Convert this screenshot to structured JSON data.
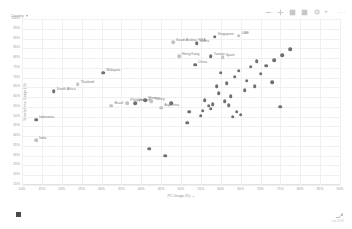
{
  "toolbar": {
    "icons": [
      {
        "name": "zoom-out-icon",
        "glyph": "minus"
      },
      {
        "name": "zoom-in-icon",
        "glyph": "plus"
      },
      {
        "name": "filter-icon",
        "glyph": "filter"
      },
      {
        "name": "table-icon",
        "glyph": "table"
      },
      {
        "name": "gear-icon",
        "glyph": "gear"
      },
      {
        "name": "more-options-icon",
        "glyph": "ellipsis"
      }
    ],
    "more_label": "···"
  },
  "legend": {
    "label": "Country"
  },
  "watermark": {
    "text": "nat 2019"
  },
  "chart_data": {
    "type": "scatter",
    "title": "",
    "xlabel": "PC Usage (%)",
    "ylabel": "Smartphone Usage (%)",
    "xlim": [
      10,
      90
    ],
    "ylim": [
      15,
      100
    ],
    "grid": true,
    "legend_position": "top-left",
    "xticks": [
      "10%",
      "15%",
      "20%",
      "25%",
      "30%",
      "35%",
      "40%",
      "45%",
      "50%",
      "55%",
      "60%",
      "65%",
      "70%",
      "75%",
      "80%",
      "85%",
      "90%"
    ],
    "yticks": [
      "100%",
      "95%",
      "90%",
      "85%",
      "80%",
      "75%",
      "70%",
      "65%",
      "60%",
      "55%",
      "50%",
      "45%",
      "40%",
      "35%",
      "30%",
      "25%",
      "20%",
      "15%"
    ],
    "points": [
      {
        "label": "India",
        "x": 13.5,
        "y": 38.0,
        "labeled": true,
        "shade": "light"
      },
      {
        "label": "Indonesia",
        "x": 13.5,
        "y": 48.5,
        "labeled": true,
        "shade": "dark"
      },
      {
        "label": "South Africa",
        "x": 18.0,
        "y": 63.0,
        "labeled": true,
        "shade": "dark"
      },
      {
        "label": "Thailand",
        "x": 24.0,
        "y": 66.5,
        "labeled": true,
        "shade": "light"
      },
      {
        "label": "Malaysia",
        "x": 30.5,
        "y": 72.5,
        "labeled": true,
        "shade": "dark"
      },
      {
        "label": "Brazil",
        "x": 32.5,
        "y": 55.5,
        "labeled": true,
        "shade": "light"
      },
      {
        "label": "Philippines",
        "x": 36.5,
        "y": 57.0,
        "labeled": true,
        "shade": "light"
      },
      {
        "label": "Vietnam",
        "x": 38.5,
        "y": 57.0,
        "labeled": true,
        "shade": "dark"
      },
      {
        "label": "Mexico",
        "x": 41.0,
        "y": 58.5,
        "labeled": true,
        "shade": "dark"
      },
      {
        "label": "Turkey",
        "x": 42.5,
        "y": 58.0,
        "labeled": true,
        "shade": "light"
      },
      {
        "label": "Argentina",
        "x": 45.0,
        "y": 54.5,
        "labeled": true,
        "shade": "light"
      },
      {
        "label": "Saudi Arabia / KSA",
        "x": 48.0,
        "y": 88.0,
        "labeled": true,
        "shade": "light"
      },
      {
        "label": "Korea",
        "x": 54.0,
        "y": 87.5,
        "labeled": true,
        "shade": "dark"
      },
      {
        "label": "Hong Kong",
        "x": 49.5,
        "y": 81.0,
        "labeled": true,
        "shade": "light"
      },
      {
        "label": "Singapore",
        "x": 58.5,
        "y": 91.0,
        "labeled": true,
        "shade": "dark"
      },
      {
        "label": "UAE",
        "x": 64.5,
        "y": 91.5,
        "labeled": true,
        "shade": "light"
      },
      {
        "label": "Taiwan",
        "x": 57.5,
        "y": 81.0,
        "labeled": true,
        "shade": "dark"
      },
      {
        "label": "Spain",
        "x": 60.5,
        "y": 80.5,
        "labeled": true,
        "shade": "light"
      },
      {
        "label": "China",
        "x": 53.5,
        "y": 76.5,
        "labeled": true,
        "shade": "dark"
      },
      {
        "label": "",
        "x": 52.0,
        "y": 52.5,
        "labeled": false,
        "shade": "dark"
      },
      {
        "label": "",
        "x": 51.5,
        "y": 47.0,
        "labeled": false,
        "shade": "dark"
      },
      {
        "label": "",
        "x": 47.5,
        "y": 57.0,
        "labeled": false,
        "shade": "dark"
      },
      {
        "label": "",
        "x": 56.0,
        "y": 58.5,
        "labeled": false,
        "shade": "dark"
      },
      {
        "label": "",
        "x": 55.5,
        "y": 53.0,
        "labeled": false,
        "shade": "dark"
      },
      {
        "label": "",
        "x": 55.0,
        "y": 50.5,
        "labeled": false,
        "shade": "dark"
      },
      {
        "label": "",
        "x": 57.0,
        "y": 55.5,
        "labeled": false,
        "shade": "dark"
      },
      {
        "label": "",
        "x": 57.5,
        "y": 54.0,
        "labeled": false,
        "shade": "dark"
      },
      {
        "label": "",
        "x": 58.0,
        "y": 56.5,
        "labeled": false,
        "shade": "dark"
      },
      {
        "label": "",
        "x": 59.5,
        "y": 62.0,
        "labeled": false,
        "shade": "dark"
      },
      {
        "label": "",
        "x": 61.0,
        "y": 58.0,
        "labeled": false,
        "shade": "dark"
      },
      {
        "label": "",
        "x": 62.0,
        "y": 56.0,
        "labeled": false,
        "shade": "dark"
      },
      {
        "label": "",
        "x": 62.5,
        "y": 60.5,
        "labeled": false,
        "shade": "dark"
      },
      {
        "label": "",
        "x": 59.0,
        "y": 65.5,
        "labeled": false,
        "shade": "dark"
      },
      {
        "label": "",
        "x": 61.5,
        "y": 67.0,
        "labeled": false,
        "shade": "dark"
      },
      {
        "label": "",
        "x": 63.5,
        "y": 70.5,
        "labeled": false,
        "shade": "dark"
      },
      {
        "label": "",
        "x": 60.0,
        "y": 72.5,
        "labeled": false,
        "shade": "dark"
      },
      {
        "label": "",
        "x": 64.5,
        "y": 73.5,
        "labeled": false,
        "shade": "dark"
      },
      {
        "label": "",
        "x": 66.5,
        "y": 68.5,
        "labeled": false,
        "shade": "dark"
      },
      {
        "label": "",
        "x": 66.0,
        "y": 63.5,
        "labeled": false,
        "shade": "dark"
      },
      {
        "label": "",
        "x": 68.5,
        "y": 65.5,
        "labeled": false,
        "shade": "dark"
      },
      {
        "label": "",
        "x": 67.5,
        "y": 75.5,
        "labeled": false,
        "shade": "dark"
      },
      {
        "label": "",
        "x": 70.0,
        "y": 72.0,
        "labeled": false,
        "shade": "dark"
      },
      {
        "label": "",
        "x": 71.5,
        "y": 76.0,
        "labeled": false,
        "shade": "dark"
      },
      {
        "label": "",
        "x": 69.0,
        "y": 78.5,
        "labeled": false,
        "shade": "dark"
      },
      {
        "label": "",
        "x": 73.5,
        "y": 79.0,
        "labeled": false,
        "shade": "dark"
      },
      {
        "label": "",
        "x": 75.5,
        "y": 81.5,
        "labeled": false,
        "shade": "dark"
      },
      {
        "label": "",
        "x": 77.5,
        "y": 84.5,
        "labeled": false,
        "shade": "dark"
      },
      {
        "label": "",
        "x": 73.0,
        "y": 67.5,
        "labeled": false,
        "shade": "dark"
      },
      {
        "label": "",
        "x": 75.0,
        "y": 55.0,
        "labeled": false,
        "shade": "dark"
      },
      {
        "label": "",
        "x": 64.0,
        "y": 52.5,
        "labeled": false,
        "shade": "dark"
      },
      {
        "label": "",
        "x": 65.0,
        "y": 51.0,
        "labeled": false,
        "shade": "dark"
      },
      {
        "label": "",
        "x": 63.0,
        "y": 50.0,
        "labeled": false,
        "shade": "dark"
      },
      {
        "label": "",
        "x": 42.0,
        "y": 33.5,
        "labeled": false,
        "shade": "dark"
      },
      {
        "label": "",
        "x": 46.0,
        "y": 30.0,
        "labeled": false,
        "shade": "dark"
      }
    ]
  }
}
